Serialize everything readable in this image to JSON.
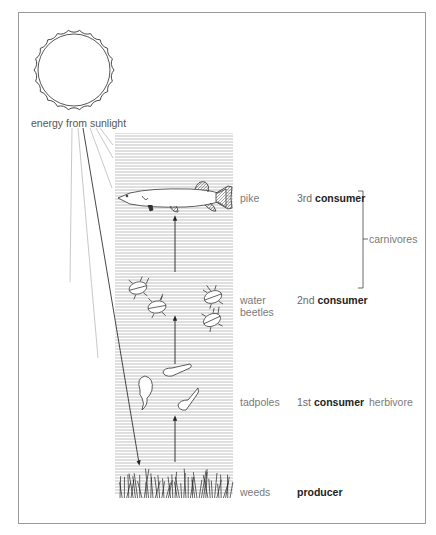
{
  "diagram": {
    "type": "food-chain",
    "energy_source": {
      "label": "energy from sunlight",
      "icon": "sun-icon"
    },
    "levels": [
      {
        "organism": "pike",
        "ordinal": "3rd",
        "role": "consumer",
        "icon": "pike-fish-icon"
      },
      {
        "organism": "water beetles",
        "organism_lines": [
          "water",
          "beetles"
        ],
        "ordinal": "2nd",
        "role": "consumer",
        "icon": "water-beetle-icon"
      },
      {
        "organism": "tadpoles",
        "ordinal": "1st",
        "role": "consumer",
        "icon": "tadpole-icon"
      },
      {
        "organism": "weeds",
        "ordinal": "",
        "role": "producer",
        "icon": "weed-icon"
      }
    ],
    "groups": {
      "carnivores": "carnivores",
      "herbivore": "herbivore"
    },
    "colors": {
      "ink": "#222222",
      "label": "#7a7a7a",
      "water_lines": "#b8b8b8",
      "frame": "#9a9a9a"
    }
  }
}
